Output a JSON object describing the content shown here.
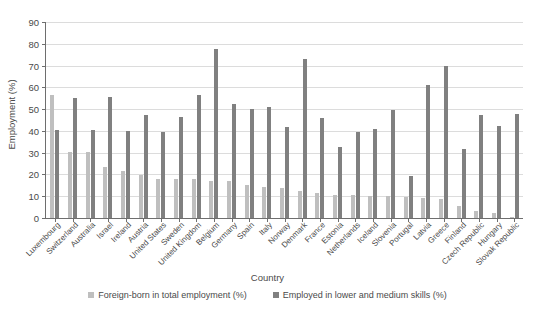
{
  "chart_data": {
    "type": "bar",
    "title": "",
    "xlabel": "Country",
    "ylabel": "Employment (%)",
    "ylim": [
      0,
      90
    ],
    "ytick_step": 10,
    "yticks": [
      0,
      10,
      20,
      30,
      40,
      50,
      60,
      70,
      80,
      90
    ],
    "grid": true,
    "legend_position": "bottom",
    "categories": [
      "Luxembourg",
      "Switzerland",
      "Australia",
      "Israel",
      "Ireland",
      "Austria",
      "United States",
      "Sweden",
      "United Kingdom",
      "Belgium",
      "Germany",
      "Spain",
      "Italy",
      "Norway",
      "Denmark",
      "France",
      "Estonia",
      "Netherlands",
      "Iceland",
      "Slovenia",
      "Portugal",
      "Latvia",
      "Greece",
      "Finland",
      "Czech Republic",
      "Hungary",
      "Slovak Republic"
    ],
    "series": [
      {
        "name": "Foreign-born in total employment (%)",
        "color": "#bfbfbf",
        "values": [
          56.3,
          30.2,
          30.1,
          23.3,
          21.5,
          19.9,
          18.1,
          17.9,
          17.7,
          17.0,
          16.8,
          15.2,
          14.3,
          13.8,
          12.5,
          11.4,
          10.6,
          10.5,
          10.1,
          9.9,
          9.8,
          9.3,
          8.8,
          5.6,
          3.4,
          2.4,
          0.5
        ]
      },
      {
        "name": "Employed in lower and medium skills (%)",
        "color": "#808080",
        "values": [
          40.3,
          55.0,
          40.5,
          55.7,
          39.9,
          47.3,
          39.3,
          46.2,
          56.3,
          77.6,
          52.2,
          50.0,
          51.2,
          42.0,
          72.9,
          45.8,
          32.7,
          39.4,
          40.8,
          49.5,
          19.5,
          61.2,
          69.6,
          31.5,
          47.3,
          42.2,
          47.6
        ]
      }
    ]
  },
  "legend": {
    "items": [
      {
        "label": "Foreign-born in total employment (%)"
      },
      {
        "label": "Employed in lower and medium skills (%)"
      }
    ]
  }
}
